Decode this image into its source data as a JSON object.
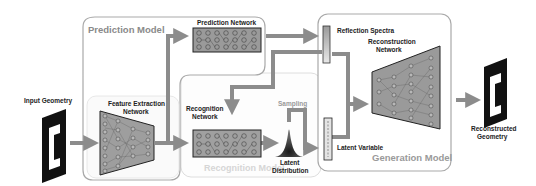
{
  "diagram": {
    "models": {
      "prediction": "Prediction Model",
      "recognition": "Recognition Model",
      "generation": "Generation Model"
    },
    "networks": {
      "prediction": "Prediction Network",
      "feature_extraction_1": "Feature Extraction",
      "feature_extraction_2": "Network",
      "recognition_1": "Recognition",
      "recognition_2": "Network",
      "reconstruction_1": "Reconstruction",
      "reconstruction_2": "Network"
    },
    "nodes": {
      "input_geometry": "Input Geometry",
      "reflection_spectra": "Reflection Spectra",
      "sampling": "Sampling",
      "latent_distribution_1": "Latent",
      "latent_distribution_2": "Distribution",
      "latent_variable": "Latent Variable",
      "reconstructed_geometry_1": "Reconstructed",
      "reconstructed_geometry_2": "Geometry"
    },
    "colors": {
      "arrow": "#8c8c8c",
      "network_fill": "#9a9a9a",
      "box_border": "#b0b0b0",
      "model_label": "#8a8a8a",
      "geometry": "#111111"
    }
  }
}
